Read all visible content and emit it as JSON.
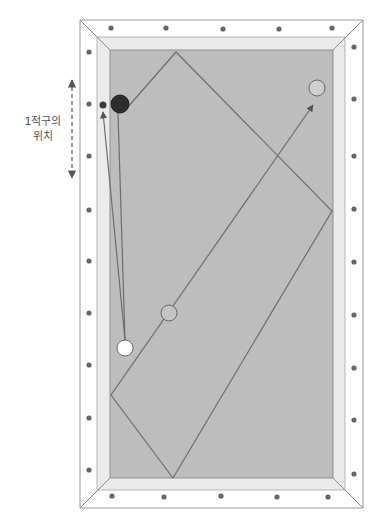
{
  "annotation": {
    "line1": "1적구의",
    "line2": "위치"
  },
  "colors": {
    "frame": "#ffffff",
    "frame_stroke": "#9a9a9a",
    "cushion": "#ebebeb",
    "cloth": "#bdbdbd",
    "diamond": "#666666",
    "path": "#6e6e6e",
    "object_ball": "#2e2e2e",
    "cue_ball": "#ffffff",
    "target_ball": "#cfcfcf"
  },
  "table": {
    "frame": {
      "x": 80,
      "y": 20,
      "w": 283,
      "h": 488
    },
    "cushion": {
      "x": 97,
      "y": 37,
      "w": 248,
      "h": 453
    },
    "cloth": {
      "x": 110,
      "y": 50,
      "w": 223,
      "h": 428
    }
  },
  "diamonds": {
    "top": [
      [
        111,
        28
      ],
      [
        166,
        28
      ],
      [
        223,
        29
      ],
      [
        279,
        29
      ],
      [
        332,
        28
      ]
    ],
    "bottom": [
      [
        112,
        496
      ],
      [
        164,
        497
      ],
      [
        221,
        496
      ],
      [
        277,
        497
      ],
      [
        328,
        497
      ]
    ],
    "left": [
      [
        89,
        52
      ],
      [
        89,
        104
      ],
      [
        89,
        156
      ],
      [
        89,
        210
      ],
      [
        89,
        261
      ],
      [
        89,
        313
      ],
      [
        89,
        365
      ],
      [
        89,
        418
      ],
      [
        89,
        470
      ]
    ],
    "right": [
      [
        354,
        47
      ],
      [
        354,
        99
      ],
      [
        354,
        156
      ],
      [
        354,
        209
      ],
      [
        354,
        262
      ],
      [
        354,
        315
      ],
      [
        354,
        368
      ],
      [
        354,
        420
      ],
      [
        354,
        474
      ]
    ]
  },
  "balls": {
    "object_ball": {
      "cx": 120,
      "cy": 104,
      "r": 9
    },
    "small_ball": {
      "cx": 103,
      "cy": 105,
      "r": 3.5
    },
    "cue_ball": {
      "cx": 125,
      "cy": 348,
      "r": 8
    },
    "ghost_ball": {
      "cx": 169,
      "cy": 313,
      "r": 8
    },
    "target_ball": {
      "cx": 317,
      "cy": 88,
      "r": 8
    }
  },
  "paths": {
    "diamond_route": [
      [
        127,
        108
      ],
      [
        176,
        52
      ],
      [
        332,
        211
      ],
      [
        173,
        478
      ],
      [
        111,
        395
      ],
      [
        313,
        105
      ]
    ],
    "cue_to_small": [
      [
        125,
        340
      ],
      [
        103,
        112
      ]
    ],
    "cue_to_object": [
      [
        125,
        340
      ],
      [
        118,
        113
      ]
    ]
  },
  "range_arrow": {
    "x": 72,
    "y1": 72,
    "y2": 186
  }
}
